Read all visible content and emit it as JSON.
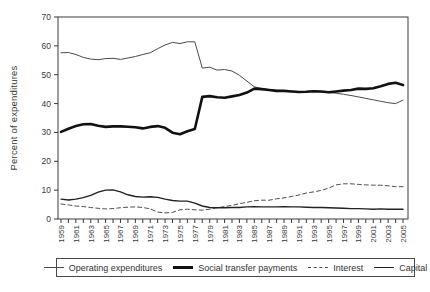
{
  "figure": {
    "background": "#ffffff",
    "axis_color": "#3a3a3a",
    "text_color": "#3a3a3a"
  },
  "chart_data": {
    "type": "line",
    "title": "",
    "xlabel": "",
    "ylabel": "Percent of expenditures",
    "ylim": [
      0,
      70
    ],
    "yticks": [
      0,
      10,
      20,
      30,
      40,
      50,
      60,
      70
    ],
    "x_range": [
      1959,
      2005
    ],
    "x_tick_every_year": true,
    "x_label_step": 2,
    "x_tick_labels": [
      "1959",
      "1961",
      "1963",
      "1965",
      "1967",
      "1969",
      "1971",
      "1973",
      "1975",
      "1977",
      "1979",
      "1981",
      "1983",
      "1985",
      "1987",
      "1989",
      "1991",
      "1993",
      "1995",
      "1997",
      "1999",
      "2001",
      "2003",
      "2005"
    ],
    "grid": false,
    "frame": true,
    "legend_position": "bottom",
    "series": [
      {
        "name": "Operating expenditures",
        "color": "#4a4a4a",
        "width": 1,
        "dash": false,
        "values": [
          57.6,
          57.7,
          57.0,
          56.0,
          55.4,
          55.2,
          55.6,
          55.7,
          55.3,
          55.8,
          56.3,
          57.0,
          57.6,
          59.0,
          60.3,
          61.2,
          60.8,
          61.4,
          61.4,
          52.3,
          52.6,
          51.6,
          51.8,
          51.3,
          49.8,
          47.8,
          45.8,
          45.2,
          44.8,
          44.6,
          44.5,
          44.3,
          44.2,
          44.2,
          44.4,
          44.0,
          43.8,
          43.6,
          43.2,
          42.8,
          42.3,
          41.8,
          41.3,
          40.8,
          40.3,
          40.0,
          41.2
        ]
      },
      {
        "name": "Social transfer payments",
        "color": "#111111",
        "width": 2.6,
        "dash": false,
        "values": [
          30.2,
          31.3,
          32.2,
          32.8,
          32.9,
          32.3,
          31.9,
          32.1,
          32.1,
          32.0,
          31.8,
          31.4,
          31.9,
          32.2,
          31.6,
          29.9,
          29.4,
          30.4,
          31.2,
          42.3,
          42.6,
          42.2,
          42.0,
          42.5,
          43.0,
          43.8,
          45.2,
          45.0,
          44.7,
          44.4,
          44.4,
          44.2,
          44.0,
          44.1,
          44.3,
          44.2,
          43.9,
          44.2,
          44.5,
          44.7,
          45.2,
          45.1,
          45.3,
          46.0,
          46.8,
          47.2,
          46.4
        ]
      },
      {
        "name": "Interest",
        "color": "#4f4f4f",
        "width": 1,
        "dash": true,
        "values": [
          5.2,
          4.9,
          4.5,
          4.3,
          4.0,
          3.7,
          3.5,
          3.6,
          3.9,
          4.1,
          4.2,
          4.0,
          3.5,
          2.4,
          2.1,
          2.3,
          3.2,
          3.4,
          3.2,
          3.1,
          3.4,
          3.9,
          4.3,
          4.7,
          5.3,
          5.8,
          6.3,
          6.5,
          6.5,
          7.0,
          7.3,
          7.8,
          8.3,
          9.0,
          9.4,
          9.9,
          10.7,
          11.8,
          12.2,
          12.2,
          12.0,
          11.8,
          11.7,
          11.7,
          11.5,
          11.2,
          11.2
        ]
      },
      {
        "name": "Capital",
        "color": "#222222",
        "width": 1.4,
        "dash": false,
        "values": [
          6.9,
          6.6,
          6.9,
          7.4,
          8.2,
          9.3,
          10.0,
          10.1,
          9.4,
          8.4,
          7.8,
          7.6,
          7.7,
          7.5,
          6.9,
          6.4,
          6.2,
          6.2,
          5.5,
          4.5,
          4.0,
          3.9,
          3.9,
          4.0,
          4.0,
          4.2,
          4.3,
          4.2,
          4.2,
          4.2,
          4.3,
          4.2,
          4.2,
          4.1,
          4.0,
          4.0,
          3.9,
          3.8,
          3.7,
          3.6,
          3.6,
          3.5,
          3.4,
          3.5,
          3.4,
          3.4,
          3.4
        ]
      }
    ]
  }
}
